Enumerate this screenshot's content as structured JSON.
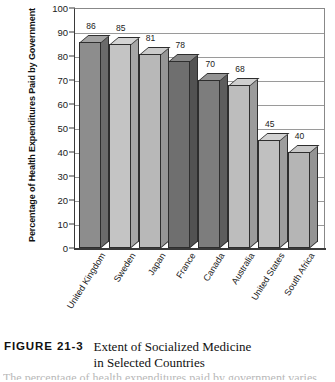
{
  "figure": {
    "number_label": "FIGURE 21-3",
    "title_line_1": "Extent of Socialized Medicine",
    "title_line_2": "in Selected Countries",
    "body_fragment": "The percentage of health expenditures paid by government varies"
  },
  "chart_data": {
    "type": "bar",
    "title": "Extent of Socialized Medicine in Selected Countries",
    "xlabel": "",
    "ylabel": "Percentage of Health Expenditures Paid by Government",
    "ylim": [
      0,
      100
    ],
    "ytick_labels": [
      "100",
      "90",
      "80",
      "70",
      "60",
      "50",
      "40",
      "30",
      "20",
      "10",
      "0"
    ],
    "yticks": [
      100,
      90,
      80,
      70,
      60,
      50,
      40,
      30,
      20,
      10,
      0
    ],
    "grid": true,
    "legend": "none",
    "three_d": true,
    "categories": [
      "United Kingdom",
      "Sweden",
      "Japan",
      "France",
      "Canada",
      "Australia",
      "United States",
      "South Africa"
    ],
    "values": [
      86,
      85,
      81,
      78,
      70,
      68,
      45,
      40
    ],
    "value_labels": [
      "86",
      "85",
      "81",
      "78",
      "70",
      "68",
      "45",
      "40"
    ],
    "bar_colors": [
      {
        "face": "#8d8d8d",
        "side": "#6b6b6b",
        "top": "#a3a3a3"
      },
      {
        "face": "#c4c4c4",
        "side": "#a6a6a6",
        "top": "#d4d4d4"
      },
      {
        "face": "#b8b8b8",
        "side": "#969696",
        "top": "#cbcbcb"
      },
      {
        "face": "#6f6f6f",
        "side": "#525252",
        "top": "#878787"
      },
      {
        "face": "#7d7d7d",
        "side": "#5d5d5d",
        "top": "#949494"
      },
      {
        "face": "#bdbdbd",
        "side": "#9b9b9b",
        "top": "#cfcfcf"
      },
      {
        "face": "#c0c0c0",
        "side": "#9e9e9e",
        "top": "#d2d2d2"
      },
      {
        "face": "#b5b5b5",
        "side": "#949494",
        "top": "#c9c9c9"
      }
    ]
  },
  "colors": {
    "axis": "#3a3a3a",
    "grid": "#9a9a9a",
    "text": "#1a1a1a",
    "background": "#ffffff"
  }
}
